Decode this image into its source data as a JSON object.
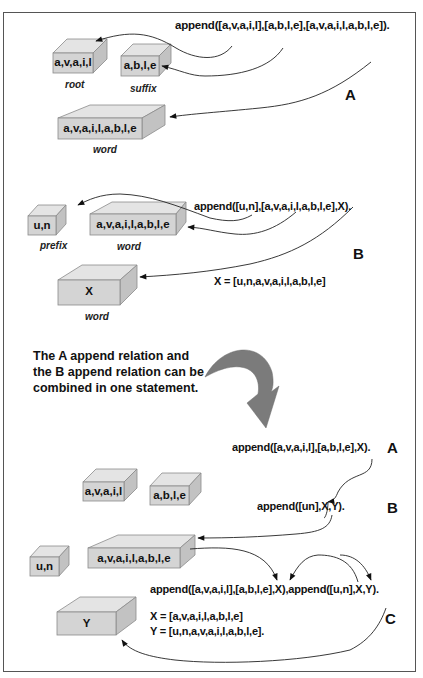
{
  "section_a": {
    "label": "A",
    "statement": "append([a,v,a,i,l],[a,b,l,e],[a,v,a,i,l,a,b,l,e]).",
    "boxes": [
      {
        "id": "root",
        "text": "a,v,a,i,l",
        "caption": "root"
      },
      {
        "id": "suffix",
        "text": "a,b,l,e",
        "caption": "suffix"
      },
      {
        "id": "word",
        "text": "a,v,a,i,l,a,b,l,e",
        "caption": "word"
      }
    ]
  },
  "section_b": {
    "label": "B",
    "statement": "append([u,n],[a,v,a,i,l,a,b,l,e],X).",
    "result": "X = [u,n,a,v,a,i,l,a,b,l,e]",
    "boxes": [
      {
        "id": "prefix",
        "text": "u,n",
        "caption": "prefix"
      },
      {
        "id": "word",
        "text": "a,v,a,i,l,a,b,l,e",
        "caption": "word"
      },
      {
        "id": "x",
        "text": "X",
        "caption": "word"
      }
    ]
  },
  "note": {
    "lines": [
      "The A append relation and",
      "the B append relation can be",
      "combined in one statement."
    ]
  },
  "section_c": {
    "label_a": "A",
    "label_b": "B",
    "label_c": "C",
    "statement_a": "append([a,v,a,i,l],[a,b,l,e],X).",
    "statement_b": "append([un],X,Y).",
    "combined": "append([a,v,a,i,l],[a,b,l,e],X),append([u,n],X,Y).",
    "result_x": "X = [a,v,a,i,l,a,b,l,e]",
    "result_y": "Y = [u,n,a,v,a,i,l,a,b,l,e].",
    "boxes": [
      {
        "id": "root",
        "text": "a,v,a,i,l"
      },
      {
        "id": "suffix",
        "text": "a,b,l,e"
      },
      {
        "id": "prefix",
        "text": "u,n"
      },
      {
        "id": "x",
        "text": "a,v,a,i,l,a,b,l,e"
      },
      {
        "id": "y",
        "text": "Y"
      }
    ]
  },
  "colors": {
    "box_front": "#d4d4d4",
    "box_top": "#e2e2e2",
    "box_side": "#c4c4c4",
    "box_edge": "#8a8a8a",
    "big_arrow": "#7a7a7a",
    "line": "#222222"
  }
}
